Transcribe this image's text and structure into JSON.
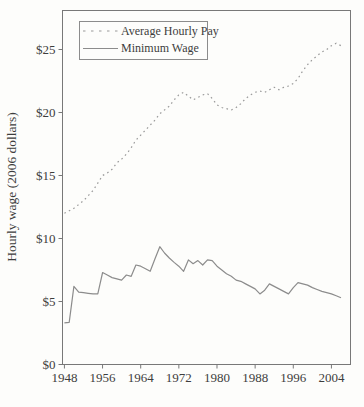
{
  "figure": {
    "background": "#fdfdfb",
    "axis_color": "#787878",
    "text_color": "#3d3d3d"
  },
  "chart_data": {
    "type": "line",
    "title": "",
    "xlabel": "",
    "ylabel": "Hourly wage (2006 dollars)",
    "xlim": [
      1948,
      2008
    ],
    "ylim": [
      0,
      28
    ],
    "grid": false,
    "legend_position": "top-left",
    "x": [
      1948,
      1949,
      1950,
      1951,
      1952,
      1953,
      1954,
      1955,
      1956,
      1957,
      1958,
      1959,
      1960,
      1961,
      1962,
      1963,
      1964,
      1965,
      1966,
      1967,
      1968,
      1969,
      1970,
      1971,
      1972,
      1973,
      1974,
      1975,
      1976,
      1977,
      1978,
      1979,
      1980,
      1981,
      1982,
      1983,
      1984,
      1985,
      1986,
      1987,
      1988,
      1989,
      1990,
      1991,
      1992,
      1993,
      1994,
      1995,
      1996,
      1997,
      1998,
      1999,
      2000,
      2001,
      2002,
      2003,
      2004,
      2005,
      2006
    ],
    "series": [
      {
        "name": "Average Hourly Pay",
        "style": "dotted",
        "color": "#9a9a9a",
        "values": [
          12.0,
          12.2,
          12.4,
          12.7,
          13.0,
          13.4,
          13.8,
          14.4,
          15.0,
          15.2,
          15.5,
          16.0,
          16.3,
          16.7,
          17.2,
          17.8,
          18.2,
          18.6,
          19.0,
          19.4,
          19.9,
          20.2,
          20.5,
          21.0,
          21.4,
          21.6,
          21.3,
          21.0,
          21.2,
          21.4,
          21.5,
          21.1,
          20.6,
          20.4,
          20.3,
          20.2,
          20.4,
          20.7,
          21.1,
          21.4,
          21.6,
          21.7,
          21.6,
          21.8,
          22.0,
          21.8,
          22.0,
          22.1,
          22.3,
          22.7,
          23.3,
          23.8,
          24.2,
          24.5,
          24.8,
          25.0,
          25.3,
          25.5,
          25.3
        ]
      },
      {
        "name": "Minimum Wage",
        "style": "solid",
        "color": "#8c8c8c",
        "values": [
          3.3,
          3.35,
          6.2,
          5.75,
          5.7,
          5.65,
          5.6,
          5.6,
          7.3,
          7.1,
          6.9,
          6.8,
          6.7,
          7.1,
          7.0,
          7.9,
          7.8,
          7.6,
          7.4,
          8.4,
          9.35,
          8.85,
          8.45,
          8.1,
          7.8,
          7.4,
          8.3,
          8.0,
          8.25,
          7.9,
          8.3,
          8.25,
          7.8,
          7.5,
          7.2,
          7.0,
          6.7,
          6.6,
          6.4,
          6.2,
          6.0,
          5.6,
          5.9,
          6.4,
          6.2,
          6.0,
          5.8,
          5.6,
          6.1,
          6.5,
          6.4,
          6.3,
          6.1,
          5.95,
          5.8,
          5.7,
          5.6,
          5.45,
          5.3
        ]
      }
    ],
    "xticks": [
      {
        "value": 1948,
        "label": "1948"
      },
      {
        "value": 1956,
        "label": "1956"
      },
      {
        "value": 1964,
        "label": "1964"
      },
      {
        "value": 1972,
        "label": "1972"
      },
      {
        "value": 1980,
        "label": "1980"
      },
      {
        "value": 1988,
        "label": "1988"
      },
      {
        "value": 1996,
        "label": "1996"
      },
      {
        "value": 2004,
        "label": "2004"
      }
    ],
    "yticks": [
      {
        "value": 0,
        "label": "$0"
      },
      {
        "value": 5,
        "label": "$5"
      },
      {
        "value": 10,
        "label": "$10"
      },
      {
        "value": 15,
        "label": "$15"
      },
      {
        "value": 20,
        "label": "$20"
      },
      {
        "value": 25,
        "label": "$25"
      }
    ]
  }
}
